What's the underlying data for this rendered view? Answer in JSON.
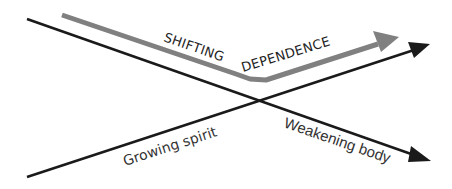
{
  "diagram": {
    "title": "",
    "colors": {
      "background": "#ffffff",
      "black_line": "#1a1a1a",
      "gray_line": "#808080",
      "text": "#222222"
    },
    "labels": {
      "shifting": "SHIFTING",
      "dependence": "DEPENDENCE",
      "growing_spirit": "Growing spirit",
      "weakening_body": "Weakening body"
    },
    "lines": [
      {
        "name": "weakening-body-line",
        "from": [
          27,
          19
        ],
        "to": [
          430,
          161
        ],
        "color": "#1a1a1a",
        "direction": "descending"
      },
      {
        "name": "growing-spirit-line",
        "from": [
          27,
          177
        ],
        "to": [
          430,
          44
        ],
        "color": "#1a1a1a",
        "direction": "ascending"
      },
      {
        "name": "shifting-dependence-arrow",
        "points": [
          [
            62,
            15
          ],
          [
            242,
            76
          ],
          [
            262,
            80
          ],
          [
            398,
            38
          ]
        ],
        "color": "#808080",
        "direction": "down-then-up"
      }
    ]
  }
}
